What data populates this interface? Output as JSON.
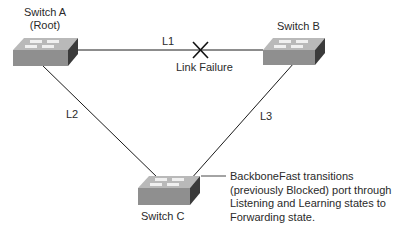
{
  "switches": {
    "a": {
      "name": "Switch A",
      "role": "(Root)"
    },
    "b": {
      "name": "Switch B"
    },
    "c": {
      "name": "Switch C"
    }
  },
  "links": {
    "l1": "L1",
    "l2": "L2",
    "l3": "L3"
  },
  "failure": {
    "label": "Link Failure",
    "icon": "x-mark-icon"
  },
  "annotation": {
    "lines": [
      "BackboneFast transitions",
      "(previously Blocked) port through",
      "Listening and Learning states to",
      "Forwarding state."
    ]
  },
  "colors": {
    "line": "#1a1a1a",
    "switch_top": "#b9b9b9",
    "switch_front": "#8f8f8f",
    "switch_side": "#3a3a3a",
    "port_marks": "#f0f0f0"
  }
}
